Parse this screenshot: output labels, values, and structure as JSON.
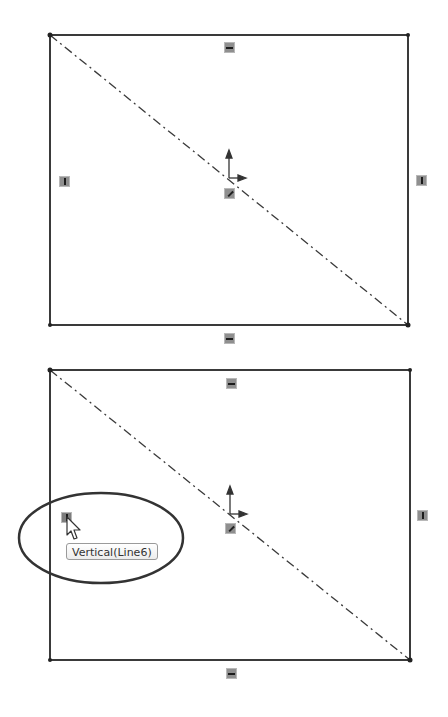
{
  "panels": [
    {
      "id": "before",
      "description": "Rectangle sketch with centerline diagonal and relation badges",
      "relations": [
        {
          "type": "horizontal",
          "position": "top-edge"
        },
        {
          "type": "horizontal",
          "position": "bottom-edge"
        },
        {
          "type": "vertical",
          "position": "left-edge"
        },
        {
          "type": "vertical",
          "position": "right-edge"
        },
        {
          "type": "coincident",
          "position": "center"
        }
      ]
    },
    {
      "id": "after",
      "description": "Same sketch with hovered vertical relation highlighted",
      "relations": [
        {
          "type": "horizontal",
          "position": "top-edge"
        },
        {
          "type": "horizontal",
          "position": "bottom-edge"
        },
        {
          "type": "vertical",
          "position": "left-edge",
          "hovered": true
        },
        {
          "type": "vertical",
          "position": "right-edge"
        },
        {
          "type": "coincident",
          "position": "center"
        }
      ],
      "tooltip": {
        "text": "Vertical(Line6)"
      },
      "callout": {
        "shape": "ellipse",
        "color": "#333333"
      }
    }
  ],
  "colors": {
    "sketch_line": "#3a3a3a",
    "badge_fill": "#8f8f8f",
    "background": "#ffffff"
  }
}
